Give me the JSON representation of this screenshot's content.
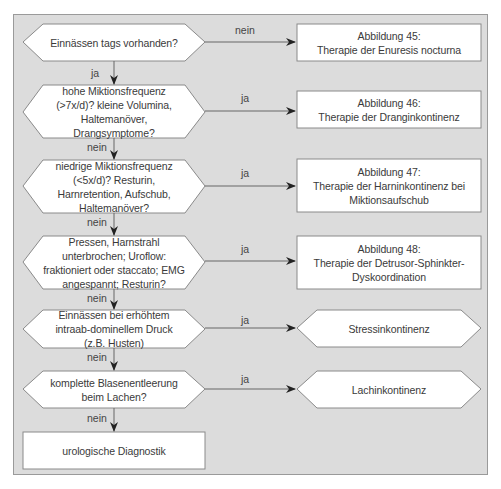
{
  "colors": {
    "panel_bg": "#dcdcdc",
    "shape_fill": "#ffffff",
    "stroke": "#8a8a8a",
    "arrow": "#222222",
    "text": "#3a3a3a"
  },
  "decisions": [
    {
      "text": "Einnässen tags vorhanden?",
      "branch_label": "nein",
      "down_label": "ja"
    },
    {
      "text": "hohe Miktionsfrequenz (>7x/d)? kleine Volumina, Haltemanöver, Drangsymptome?",
      "branch_label": "ja",
      "down_label": "nein"
    },
    {
      "text": "niedrige Miktionsfrequenz (<5x/d)?  Resturin, Harnretention, Aufschub, Haltemanöver?",
      "branch_label": "ja",
      "down_label": "nein"
    },
    {
      "text": "Pressen, Harnstrahl unterbrochen; Uroflow: fraktioniert oder staccato; EMG angespannt; Resturin?",
      "branch_label": "ja",
      "down_label": "nein"
    },
    {
      "text": "Einnässen bei erhöhtem intraab-dominellem Druck (z.B. Husten)",
      "branch_label": "ja",
      "down_label": "nein"
    },
    {
      "text": "komplette Blasenentleerung beim Lachen?",
      "branch_label": "ja",
      "down_label": "nein"
    }
  ],
  "outcomes": [
    {
      "line1": "Abbildung 45:",
      "line2": "Therapie der Enuresis nocturna",
      "shape": "box"
    },
    {
      "line1": "Abbildung 46:",
      "line2": "Therapie der Dranginkontinenz",
      "shape": "box"
    },
    {
      "line1": "Abbildung 47:",
      "line2": "Therapie der Harninkontinenz bei Miktionsaufschub",
      "shape": "box"
    },
    {
      "line1": "Abbildung 48:",
      "line2": "Therapie der Detrusor-Sphinkter-Dyskoordination",
      "shape": "box"
    },
    {
      "line1": "Stressinkontinenz",
      "line2": "",
      "shape": "terminal"
    },
    {
      "line1": "Lachinkontinenz",
      "line2": "",
      "shape": "terminal"
    }
  ],
  "final": {
    "text": "urologische Diagnostik"
  }
}
